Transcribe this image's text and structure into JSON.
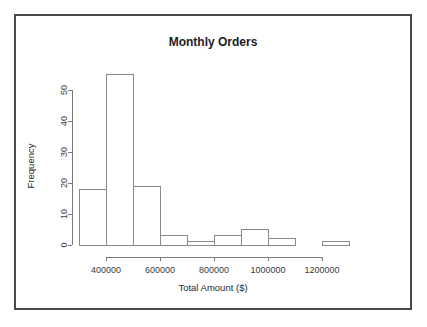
{
  "figure": {
    "background_color": "#ffffff",
    "frame_color": "#4a4a4a",
    "axis_color": "#7a7a7a",
    "bar_stroke_color": "#8a8a8a",
    "bar_fill_color": "#ffffff"
  },
  "chart_data": {
    "type": "bar",
    "title": "Monthly Orders",
    "xlabel": "Total Amount ($)",
    "ylabel": "Frequency",
    "bin_width": 100000,
    "bin_edges": [
      300000,
      400000,
      500000,
      600000,
      700000,
      800000,
      900000,
      1000000,
      1100000,
      1200000,
      1300000
    ],
    "categories": [
      "300000-400000",
      "400000-500000",
      "500000-600000",
      "600000-700000",
      "700000-800000",
      "800000-900000",
      "900000-1000000",
      "1000000-1100000",
      "1100000-1200000",
      "1200000-1300000"
    ],
    "values": [
      18,
      55,
      19,
      3,
      1,
      3,
      5,
      2,
      0,
      1
    ],
    "xlim": [
      300000,
      1300000
    ],
    "ylim": [
      0,
      55
    ],
    "x_ticks": [
      400000,
      600000,
      800000,
      1000000,
      1200000
    ],
    "x_tick_labels": [
      "400000",
      "600000",
      "800000",
      "1000000",
      "1200000"
    ],
    "y_ticks": [
      0,
      10,
      20,
      30,
      40,
      50
    ],
    "y_tick_labels": [
      "0",
      "10",
      "20",
      "30",
      "40",
      "50"
    ],
    "grid": false,
    "legend": false
  }
}
